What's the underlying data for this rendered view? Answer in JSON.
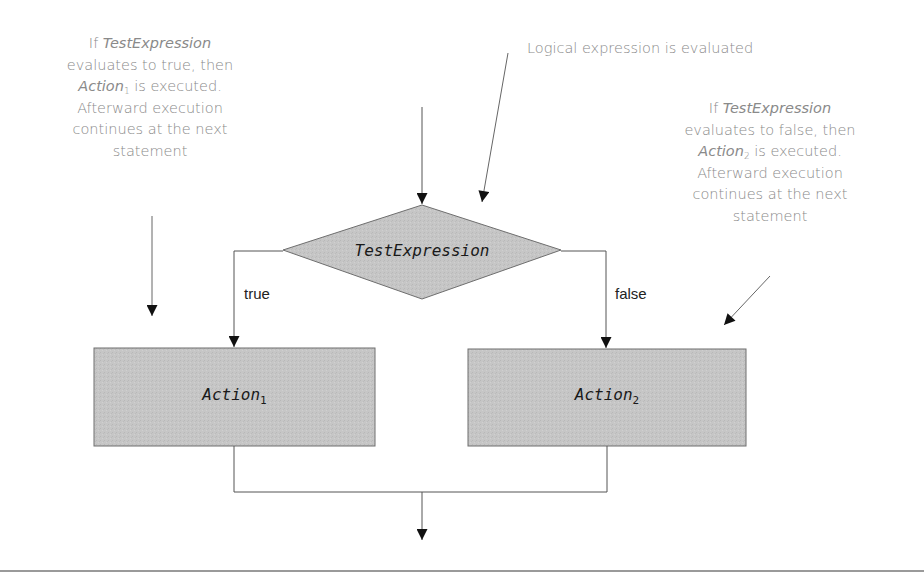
{
  "diagram": {
    "type": "flowchart-if-else",
    "decision": {
      "label": "TestExpression"
    },
    "actions": [
      {
        "label": "Action",
        "subscript": "1"
      },
      {
        "label": "Action",
        "subscript": "2"
      }
    ],
    "branches": {
      "true_label": "true",
      "false_label": "false"
    },
    "annotations": {
      "top_center": {
        "text": "Logical expression is evaluated"
      },
      "left": {
        "line1_prefix": "If ",
        "line1_italic": "TestExpression",
        "line2": "evaluates to true, then",
        "line3_italic": "Action",
        "line3_sub": "1",
        "line3_suffix": " is executed.",
        "line4": "Afterward execution",
        "line5": "continues at the next",
        "line6": "statement"
      },
      "right": {
        "line1_prefix": "If ",
        "line1_italic": "TestExpression",
        "line2": "evaluates to false, then",
        "line3_italic": "Action",
        "line3_sub": "2",
        "line3_suffix": " is executed.",
        "line4": "Afterward execution",
        "line5": "continues at the next",
        "line6": "statement"
      }
    },
    "colors": {
      "shape_fill": "#c4c4c4",
      "shape_stroke": "#6e6e6e",
      "line": "#555555",
      "annotation_text": "#8a8a8a",
      "label_text": "#1a1a1a",
      "rule": "#9a9a9a"
    }
  }
}
